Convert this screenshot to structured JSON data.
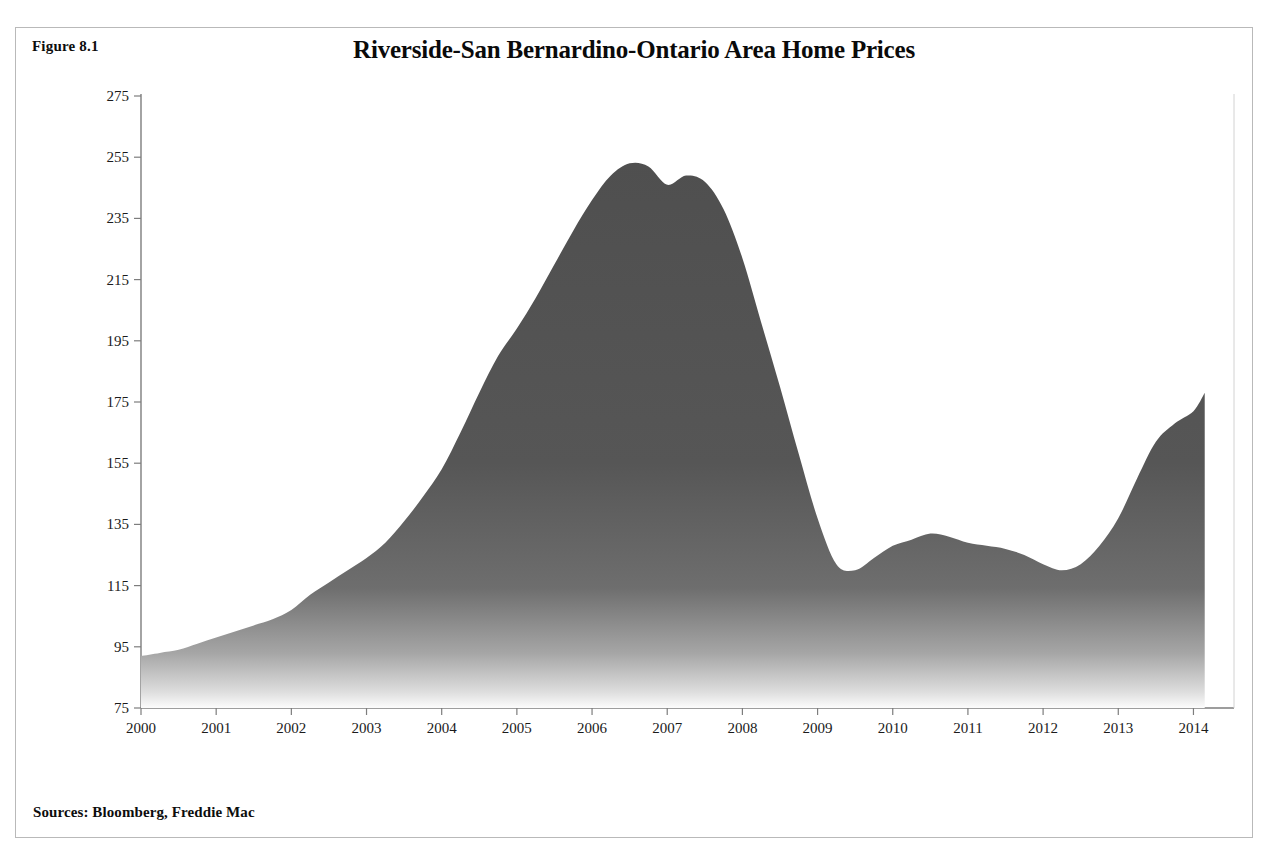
{
  "figure": {
    "number_label": "Figure 8.1",
    "title": "Riverside-San Bernardino-Ontario Area Home Prices",
    "sources": "Sources: Bloomberg, Freddie Mac"
  },
  "colors": {
    "area_fill_top": "#545454",
    "area_fill_bottom": "#fbfbfb",
    "axis": "#7d7d7d",
    "text": "#111111",
    "frame_border": "#b9b9b9",
    "page_background": "#ffffff"
  },
  "chart_data": {
    "type": "area",
    "title": "Riverside-San Bernardino-Ontario Area Home Prices",
    "xlabel": "",
    "ylabel": "Freddie Mac House Price Index",
    "xlim": [
      2000,
      2014.3
    ],
    "ylim": [
      75,
      275
    ],
    "grid": false,
    "legend": null,
    "y_ticks": [
      75,
      95,
      115,
      135,
      155,
      175,
      195,
      215,
      235,
      255,
      275
    ],
    "x_ticks": [
      2000,
      2001,
      2002,
      2003,
      2004,
      2005,
      2006,
      2007,
      2008,
      2009,
      2010,
      2011,
      2012,
      2013,
      2014
    ],
    "x_tick_labels": [
      "2000",
      "2001",
      "2002",
      "2003",
      "2004",
      "2005",
      "2006",
      "2007",
      "2008",
      "2009",
      "2010",
      "2011",
      "2012",
      "2013",
      "2014"
    ],
    "y_tick_labels": [
      "75",
      "95",
      "115",
      "135",
      "155",
      "175",
      "195",
      "215",
      "235",
      "255",
      "275"
    ],
    "series": [
      {
        "name": "Freddie Mac House Price Index",
        "x": [
          2000.0,
          2000.25,
          2000.5,
          2000.75,
          2001.0,
          2001.25,
          2001.5,
          2001.75,
          2002.0,
          2002.25,
          2002.5,
          2002.75,
          2003.0,
          2003.25,
          2003.5,
          2003.75,
          2004.0,
          2004.25,
          2004.5,
          2004.75,
          2005.0,
          2005.25,
          2005.5,
          2005.75,
          2006.0,
          2006.25,
          2006.5,
          2006.75,
          2007.0,
          2007.25,
          2007.5,
          2007.75,
          2008.0,
          2008.25,
          2008.5,
          2008.75,
          2009.0,
          2009.25,
          2009.5,
          2009.75,
          2010.0,
          2010.25,
          2010.5,
          2010.75,
          2011.0,
          2011.25,
          2011.5,
          2011.75,
          2012.0,
          2012.25,
          2012.5,
          2012.75,
          2013.0,
          2013.25,
          2013.5,
          2013.75,
          2014.0,
          2014.15
        ],
        "values": [
          92,
          93,
          94,
          96,
          98,
          100,
          102,
          104,
          107,
          112,
          116,
          120,
          124,
          129,
          136,
          144,
          153,
          165,
          178,
          190,
          199,
          209,
          220,
          231,
          241,
          249,
          253,
          252,
          246,
          249,
          247,
          238,
          222,
          201,
          180,
          158,
          137,
          122,
          120,
          124,
          128,
          130,
          132,
          131,
          129,
          128,
          127,
          125,
          122,
          120,
          122,
          128,
          137,
          150,
          162,
          168,
          172,
          178
        ]
      }
    ],
    "annotations": {
      "peak_value": 253,
      "peak_x": 2006.5,
      "trough_value": 120,
      "trough_x": 2009.5,
      "start_value": 92,
      "end_value": 178
    }
  },
  "axes_geometry": {
    "plot_left": 125,
    "plot_right": 1200,
    "plot_top": 68,
    "plot_bottom": 680
  }
}
